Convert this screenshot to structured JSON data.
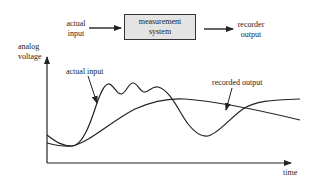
{
  "block_diagram": {
    "input_label_line1": "actual",
    "input_label_line2": "input",
    "system_label_line1": "measurement",
    "system_label_line2": "system",
    "output_label_line1": "recorder",
    "output_label_line2": "output"
  },
  "plot": {
    "y_axis_label_line1": "analog",
    "y_axis_label_line2": "voltage",
    "x_axis_label": "time",
    "curves": [
      {
        "name": "actual input",
        "annotation": "actual input"
      },
      {
        "name": "recorded output",
        "annotation": "recorded output"
      }
    ]
  },
  "colors": {
    "line": "#222222",
    "box_fill": "#e4e4e4"
  }
}
